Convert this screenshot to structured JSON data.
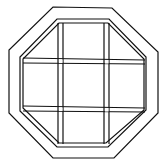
{
  "image": {
    "subject": "octagonal window line drawing",
    "description": "Octagon-shaped window with a double frame and a 3x3 grid of muntins",
    "stroke_color": "#111111",
    "background_color": "#ffffff",
    "grid": {
      "rows": 3,
      "cols": 3
    }
  }
}
